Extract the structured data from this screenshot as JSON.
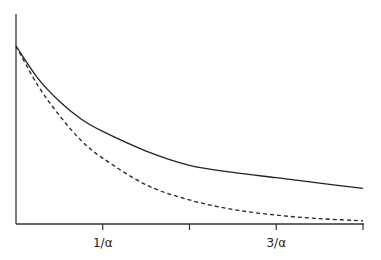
{
  "chart_data": {
    "type": "line",
    "title": "",
    "xlabel": "",
    "ylabel": "",
    "xlim": [
      0,
      4
    ],
    "ylim": [
      0,
      1
    ],
    "grid": false,
    "legend": "none",
    "xticks": [
      {
        "value": 1,
        "label": "1/α"
      },
      {
        "value": 2,
        "label": ""
      },
      {
        "value": 3,
        "label": "3/α"
      },
      {
        "value": 4,
        "label": ""
      }
    ],
    "series": [
      {
        "name": "solid-curve",
        "style": "solid",
        "x": [
          0,
          0.25,
          0.5,
          0.75,
          1,
          1.5,
          2,
          2.5,
          3,
          3.5,
          4
        ],
        "y": [
          1.0,
          0.82,
          0.69,
          0.59,
          0.52,
          0.41,
          0.33,
          0.29,
          0.26,
          0.23,
          0.2
        ]
      },
      {
        "name": "dashed-curve",
        "style": "dashed",
        "x": [
          0,
          0.25,
          0.5,
          0.75,
          1,
          1.5,
          2,
          2.5,
          3,
          3.5,
          4
        ],
        "y": [
          1.0,
          0.78,
          0.61,
          0.47,
          0.37,
          0.22,
          0.135,
          0.082,
          0.05,
          0.03,
          0.018
        ]
      }
    ]
  }
}
